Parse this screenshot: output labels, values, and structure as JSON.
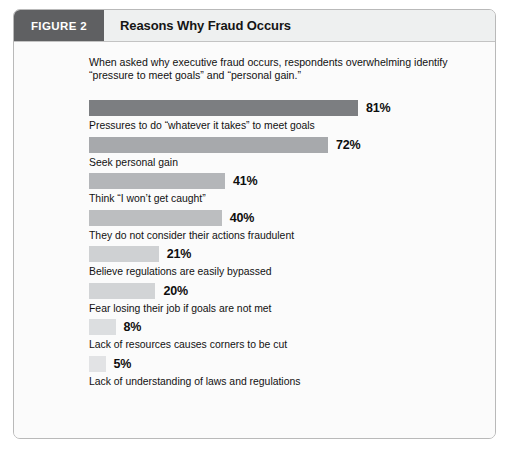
{
  "figure": {
    "tag": "FIGURE 2",
    "title": "Reasons Why Fraud Occurs",
    "intro": "When asked why executive fraud occurs, respondents overwhelming identify “pressure to meet goals” and “personal gain.”"
  },
  "colors": {
    "tag_background": "#5f6062",
    "header_background": "#eef0f0",
    "frame_border": "#b9b9b9",
    "panel_background": "#fbfbfb",
    "bar_darkest": "#7c7e81",
    "bar_lightest": "#e2e3e5"
  },
  "chart_data": {
    "type": "bar",
    "orientation": "horizontal",
    "title": "Reasons Why Fraud Occurs",
    "subtitle": "When asked why executive fraud occurs, respondents overwhelming identify “pressure to meet goals” and “personal gain.”",
    "xlabel": "",
    "ylabel": "",
    "xlim": [
      0,
      100
    ],
    "grid": false,
    "legend": "none",
    "value_suffix": "%",
    "categories": [
      "Pressures to do “whatever it takes” to meet goals",
      "Seek personal gain",
      "Think “I won’t get caught”",
      "They do not consider their actions fraudulent",
      "Believe regulations are easily bypassed",
      "Fear losing their job if goals are not met",
      "Lack of resources causes corners to be cut",
      "Lack of understanding of laws and regulations"
    ],
    "values": [
      81,
      72,
      41,
      40,
      21,
      20,
      8,
      5
    ],
    "value_labels": [
      "81%",
      "72%",
      "41%",
      "40%",
      "21%",
      "20%",
      "8%",
      "5%"
    ],
    "bar_colors": [
      "#7c7e81",
      "#a7a9ac",
      "#b4b6b9",
      "#bcbec0",
      "#cfd1d3",
      "#d2d4d6",
      "#dcdee0",
      "#e2e3e5"
    ]
  }
}
